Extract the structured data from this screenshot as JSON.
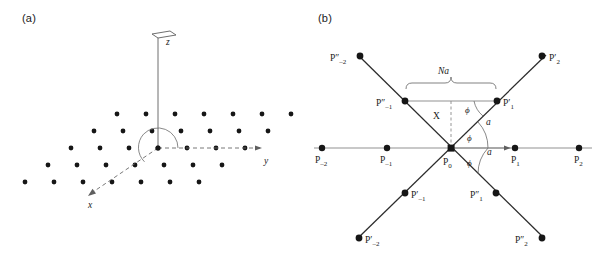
{
  "figure": {
    "background_color": "#ffffff",
    "dot_color": "#161616",
    "ray_color": "#2b2b2b",
    "axis_color": "#5f5f5f"
  },
  "panel_a": {
    "label": "(a)",
    "axes": [
      {
        "name": "z",
        "label": "z",
        "direction": "up",
        "style": "solid-with-plate-arrow"
      },
      {
        "name": "y",
        "label": "y",
        "direction": "right",
        "style": "dashed-with-arrow"
      },
      {
        "name": "x",
        "label": "x",
        "direction": "down-left",
        "style": "dashed-with-arrow"
      }
    ],
    "description": "hexagonal lattice of points in the xy-plane with z axis out of plane",
    "angle_arc": "half-circle arc at origin between x and y axes",
    "lattice": {
      "rows": [
        {
          "y": 114,
          "x_start": 117,
          "count": 7,
          "dx": 29
        },
        {
          "y": 131,
          "x_start": 94,
          "count": 7,
          "dx": 29
        },
        {
          "y": 148,
          "x_start": 71,
          "count": 7,
          "dx": 29
        },
        {
          "y": 165,
          "x_start": 48,
          "count": 7,
          "dx": 29
        },
        {
          "y": 182,
          "x_start": 25,
          "count": 7,
          "dx": 29
        }
      ]
    }
  },
  "panel_b": {
    "label": "(b)",
    "description": "three intersecting lines of lattice points through common origin P0, with interline angle phi and lattice spacing a",
    "origin_label": "P",
    "origin_sub": "0",
    "span_label": "Na",
    "projection_label": "X",
    "spacing_label": "a",
    "angle_label": "ϕ",
    "angle_count": 3,
    "points": [
      {
        "id": "P-2",
        "base": "P",
        "prime": "",
        "sub": "–2"
      },
      {
        "id": "P-1",
        "base": "P",
        "prime": "",
        "sub": "–1"
      },
      {
        "id": "P0",
        "base": "P",
        "prime": "",
        "sub": "0"
      },
      {
        "id": "P1",
        "base": "P",
        "prime": "",
        "sub": "1"
      },
      {
        "id": "P2",
        "base": "P",
        "prime": "",
        "sub": "2"
      },
      {
        "id": "Pp1",
        "base": "P",
        "prime": "′",
        "sub": "1"
      },
      {
        "id": "Pp2",
        "base": "P",
        "prime": "′",
        "sub": "2"
      },
      {
        "id": "Pp-1",
        "base": "P",
        "prime": "′",
        "sub": "–1"
      },
      {
        "id": "Pp-2",
        "base": "P",
        "prime": "′",
        "sub": "–2"
      },
      {
        "id": "Ppp1",
        "base": "P",
        "prime": "″",
        "sub": "1"
      },
      {
        "id": "Ppp2",
        "base": "P",
        "prime": "″",
        "sub": "2"
      },
      {
        "id": "Ppp-1",
        "base": "P",
        "prime": "″",
        "sub": "–1"
      },
      {
        "id": "Ppp-2",
        "base": "P",
        "prime": "″",
        "sub": "–2"
      }
    ]
  }
}
